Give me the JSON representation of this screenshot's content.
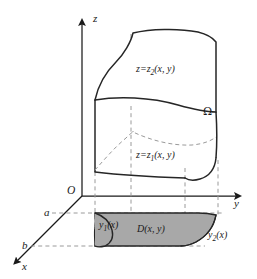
{
  "figure": {
    "axes": {
      "z_label": "z",
      "y_label": "y",
      "x_label": "x",
      "origin_label": "O"
    },
    "marks": {
      "a_label": "a",
      "b_label": "b"
    },
    "surfaces": {
      "upper_label": "z=z",
      "upper_sub": "2",
      "upper_args": "(x, y)",
      "lower_label": "z=z",
      "lower_sub": "1",
      "lower_args": "(x, y)"
    },
    "solid": {
      "omega_label": "Ω"
    },
    "projection": {
      "region_label": "D(x, y)",
      "left_boundary_label": "y",
      "left_boundary_sub": "1",
      "left_boundary_args": "(x)",
      "right_boundary_label": "y",
      "right_boundary_sub": "2",
      "right_boundary_args": "(x)"
    },
    "colors": {
      "ink": "#1a1a1a",
      "stroke": "#262626",
      "dashed": "#9a9a9a",
      "region_fill": "#a8a8a8",
      "background": "#ffffff"
    }
  }
}
